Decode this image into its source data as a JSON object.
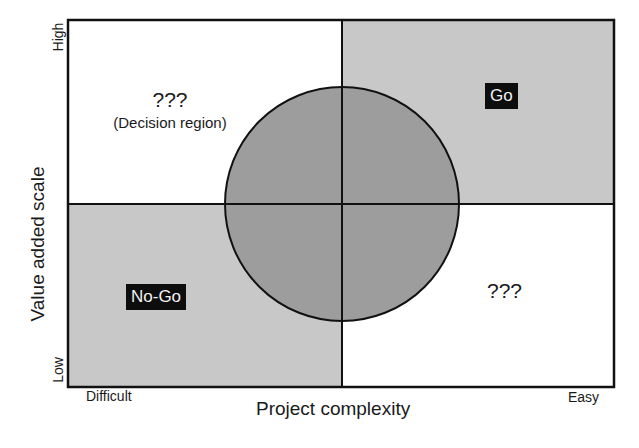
{
  "diagram": {
    "type": "quadrant-matrix",
    "colors": {
      "shaded_quadrant": "#c8c8c8",
      "white_quadrant": "#ffffff",
      "circle_fill": "#9d9d9d",
      "lines": "#111111",
      "tag_bg": "#0d0d0d",
      "tag_text": "#f2f2f2"
    },
    "quadrants": {
      "top_left": {
        "title": "???",
        "subtitle": "(Decision region)",
        "shaded": false
      },
      "top_right": {
        "label": "Go",
        "shaded": true
      },
      "bottom_left": {
        "label": "No-Go",
        "shaded": true
      },
      "bottom_right": {
        "title": "???",
        "shaded": false
      }
    },
    "center_circle": {
      "description": "overlapping decision zone"
    }
  },
  "axes": {
    "x": {
      "title": "Project complexity",
      "min_label": "Difficult",
      "max_label": "Easy"
    },
    "y": {
      "title": "Value added scale",
      "min_label": "Low",
      "max_label": "High"
    }
  }
}
